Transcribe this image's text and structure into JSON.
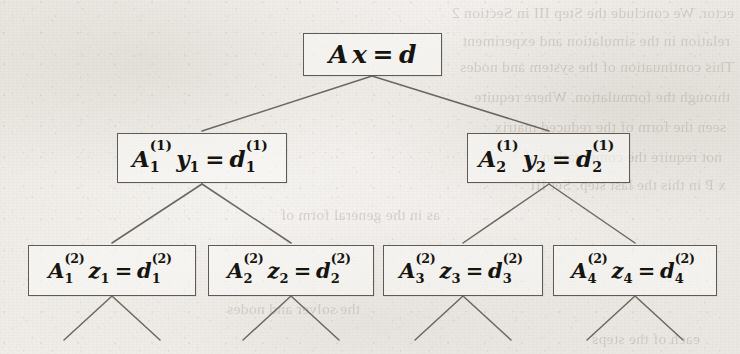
{
  "figure": {
    "kind": "recursive-binary-decomposition-tree",
    "levels": 3,
    "caption_visible": false
  },
  "root": {
    "id": "root",
    "label": "Ax = d",
    "matrix": {
      "base": "A",
      "sup": "",
      "sub": ""
    },
    "vector": "x",
    "equals": "=",
    "rhs": {
      "base": "d",
      "sup": "",
      "sub": ""
    }
  },
  "level1": [
    {
      "id": "n1-1",
      "label": "A1(1) y1 = d1(1)",
      "matrix": {
        "base": "A",
        "sup": "(1)",
        "sub": "1"
      },
      "vector": "y",
      "vector_sub": "1",
      "equals": "=",
      "rhs": {
        "base": "d",
        "sup": "(1)",
        "sub": "1"
      }
    },
    {
      "id": "n1-2",
      "label": "A2(1) y2 = d2(1)",
      "matrix": {
        "base": "A",
        "sup": "(1)",
        "sub": "2"
      },
      "vector": "y",
      "vector_sub": "2",
      "equals": "=",
      "rhs": {
        "base": "d",
        "sup": "(1)",
        "sub": "2"
      }
    }
  ],
  "level2": [
    {
      "id": "n2-1",
      "label": "A1(2) z1 = d1(2)",
      "matrix": {
        "base": "A",
        "sup": "(2)",
        "sub": "1"
      },
      "vector": "z",
      "vector_sub": "1",
      "equals": "=",
      "rhs": {
        "base": "d",
        "sup": "(2)",
        "sub": "1"
      }
    },
    {
      "id": "n2-2",
      "label": "A2(2) z2 = d2(2)",
      "matrix": {
        "base": "A",
        "sup": "(2)",
        "sub": "2"
      },
      "vector": "z",
      "vector_sub": "2",
      "equals": "=",
      "rhs": {
        "base": "d",
        "sup": "(2)",
        "sub": "2"
      }
    },
    {
      "id": "n2-3",
      "label": "A3(2) z3 = d3(2)",
      "matrix": {
        "base": "A",
        "sup": "(2)",
        "sub": "3"
      },
      "vector": "z",
      "vector_sub": "3",
      "equals": "=",
      "rhs": {
        "base": "d",
        "sup": "(2)",
        "sub": "3"
      }
    },
    {
      "id": "n2-4",
      "label": "A4(2) z4 = d4(2)",
      "matrix": {
        "base": "A",
        "sup": "(2)",
        "sub": "4"
      },
      "vector": "z",
      "vector_sub": "4",
      "equals": "=",
      "rhs": {
        "base": "d",
        "sup": "(2)",
        "sub": "4"
      }
    }
  ],
  "colors": {
    "paper": "#f2efec",
    "ink": "#16140f",
    "rule": "#5e5a55",
    "edge": "#6b6760",
    "bleed": "#a9a196"
  },
  "bleed_text": {
    "note": "faint mirrored show-through from the reverse side of the scanned page",
    "lines": [
      {
        "text": "ector. We conclude the Step III in Section 2",
        "x": 6,
        "y": 4
      },
      {
        "text": "relation in the simulation and experiment",
        "x": 10,
        "y": 32
      },
      {
        "text": "This continuation of the system and nodes",
        "x": 6,
        "y": 58
      },
      {
        "text": "through the formulation. Where require",
        "x": 10,
        "y": 88
      },
      {
        "text": "seen the form of the reduced matrix",
        "x": 14,
        "y": 118
      },
      {
        "text": "not require the computation of",
        "x": 18,
        "y": 148
      },
      {
        "text": "x P in this the last step. Set III",
        "x": 14,
        "y": 176
      },
      {
        "text": "as in the general form of",
        "x": 300,
        "y": 206
      },
      {
        "text": "the solver and nodes",
        "x": 380,
        "y": 300
      },
      {
        "text": "each of the steps",
        "x": 40,
        "y": 330
      }
    ]
  }
}
